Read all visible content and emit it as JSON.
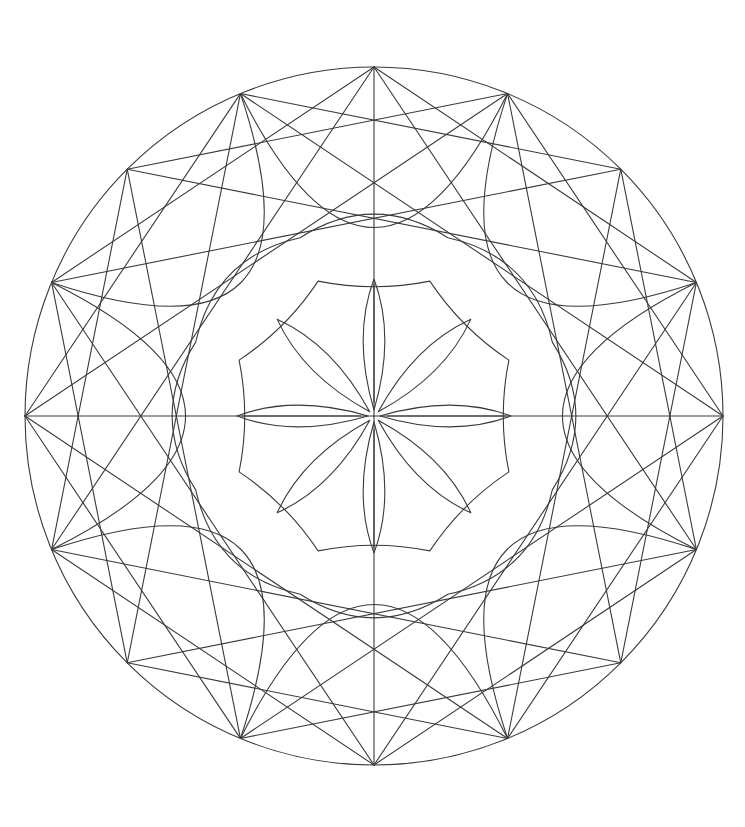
{
  "page": {
    "background_color": "#ffffff",
    "width": 745,
    "height": 827
  },
  "artwork": {
    "name": "Eight-Point Star Mandala",
    "type": "line-art",
    "stroke_color": "#3a3a3a",
    "fill_color": "none",
    "stroke_width": 1.1,
    "center_x": 374,
    "center_y": 416,
    "symmetry_order": 8,
    "rings": [
      {
        "name": "outer-circle",
        "kind": "circle",
        "radius": 349,
        "description": "Outer bounding circle of the mandala"
      },
      {
        "name": "outer-vertex-ring",
        "kind": "vertex-ring",
        "radius": 349,
        "count": 16,
        "start_angle_deg": -90,
        "description": "Sixteen vertices evenly spaced on the outer circle"
      },
      {
        "name": "outer-star-16",
        "kind": "star-polygon",
        "radius": 349,
        "points": 16,
        "skip": 3,
        "start_angle_deg": -90,
        "description": "Sixteen point star polygon chords {16/3} spanning the outer circle"
      },
      {
        "name": "outer-star-16-b",
        "kind": "star-polygon",
        "radius": 349,
        "points": 16,
        "skip": 5,
        "start_angle_deg": -90,
        "description": "Secondary star polygon chords {16/5}"
      },
      {
        "name": "cardinal-spokes",
        "kind": "spokes",
        "radius": 349,
        "inner_radius": 0,
        "count": 4,
        "start_angle_deg": -90,
        "description": "Vertical and horizontal diameters through the center"
      },
      {
        "name": "petal-arc-ring",
        "kind": "arc-ring",
        "radius": 349,
        "count": 8,
        "bulge": 0.46,
        "start_angle_deg": -67.5,
        "description": "Eight broad arcs sweeping between alternating outer vertices forming the vesica lattice"
      },
      {
        "name": "inner-bound-circle",
        "kind": "arc-octagon",
        "radius": 193,
        "count": 8,
        "bulge": 0.12,
        "start_angle_deg": -67.5,
        "description": "Rounded octagon bounding the inner medallion"
      },
      {
        "name": "medallion-arc-octagon",
        "kind": "concave-octagon",
        "radius": 146,
        "count": 8,
        "concavity": 0.3,
        "start_angle_deg": -67.5,
        "description": "Concave scalloped octagon ring around the central flower"
      },
      {
        "name": "central-flower",
        "kind": "petal-flower",
        "outer_radius": 137,
        "inner_radius": 6,
        "petals": 8,
        "petal_width": 0.34,
        "start_angle_deg": -90,
        "description": "Central eight petal flower with sharply pointed lens shaped petals"
      },
      {
        "name": "petal-midribs",
        "kind": "midribs",
        "radius": 137,
        "count": 8,
        "start_angle_deg": -90,
        "description": "Straight midrib lines along the cardinal petals"
      }
    ],
    "key_points": {
      "top_vertex": [
        374,
        67
      ],
      "bottom_vertex": [
        374,
        765
      ],
      "left_vertex": [
        25,
        416
      ],
      "right_vertex": [
        723,
        416
      ],
      "upper_left_vertex": [
        70,
        238
      ],
      "upper_right_vertex": [
        678,
        238
      ],
      "cardinal_petal_tip_left": [
        237,
        416
      ],
      "cardinal_petal_tip_right": [
        511,
        416
      ],
      "diagonal_petal_tip_upper_left": [
        304,
        293
      ]
    }
  }
}
